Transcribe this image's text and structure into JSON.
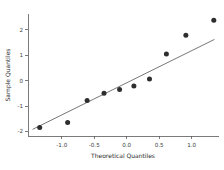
{
  "chart_data": {
    "type": "scatter",
    "title": "",
    "subtitle": "",
    "xlabel": "Theoretical Quantiles",
    "ylabel": "Sample Quantiles",
    "xlim": [
      -1.52,
      1.42
    ],
    "ylim": [
      -2.18,
      2.62
    ],
    "grid": false,
    "legend": null,
    "xticks": [
      -1.0,
      -0.5,
      0.0,
      0.5,
      1.0
    ],
    "xticklabels": [
      "-1.0",
      "-0.5",
      "0.0",
      "0.5",
      "1.0"
    ],
    "yticks": [
      -2,
      -1,
      0,
      1,
      2
    ],
    "yticklabels": [
      "-2",
      "-1",
      "0",
      "1",
      "2"
    ],
    "series": [
      {
        "name": "sample-quantiles",
        "type": "scatter",
        "marker": "circle",
        "color": "#2e2e2e",
        "x": [
          -1.34,
          -0.91,
          -0.61,
          -0.35,
          -0.11,
          0.11,
          0.35,
          0.61,
          0.91,
          1.34
        ],
        "y": [
          -1.85,
          -1.65,
          -0.78,
          -0.5,
          -0.35,
          -0.21,
          0.06,
          1.05,
          1.78,
          2.37
        ]
      },
      {
        "name": "reference-line",
        "type": "line",
        "color": "#4a4a4a",
        "x": [
          -1.45,
          1.35
        ],
        "y": [
          -1.92,
          1.62
        ]
      }
    ]
  },
  "axes": {
    "x_title": "Theoretical Quantiles",
    "y_title": "Sample Quantiles"
  }
}
